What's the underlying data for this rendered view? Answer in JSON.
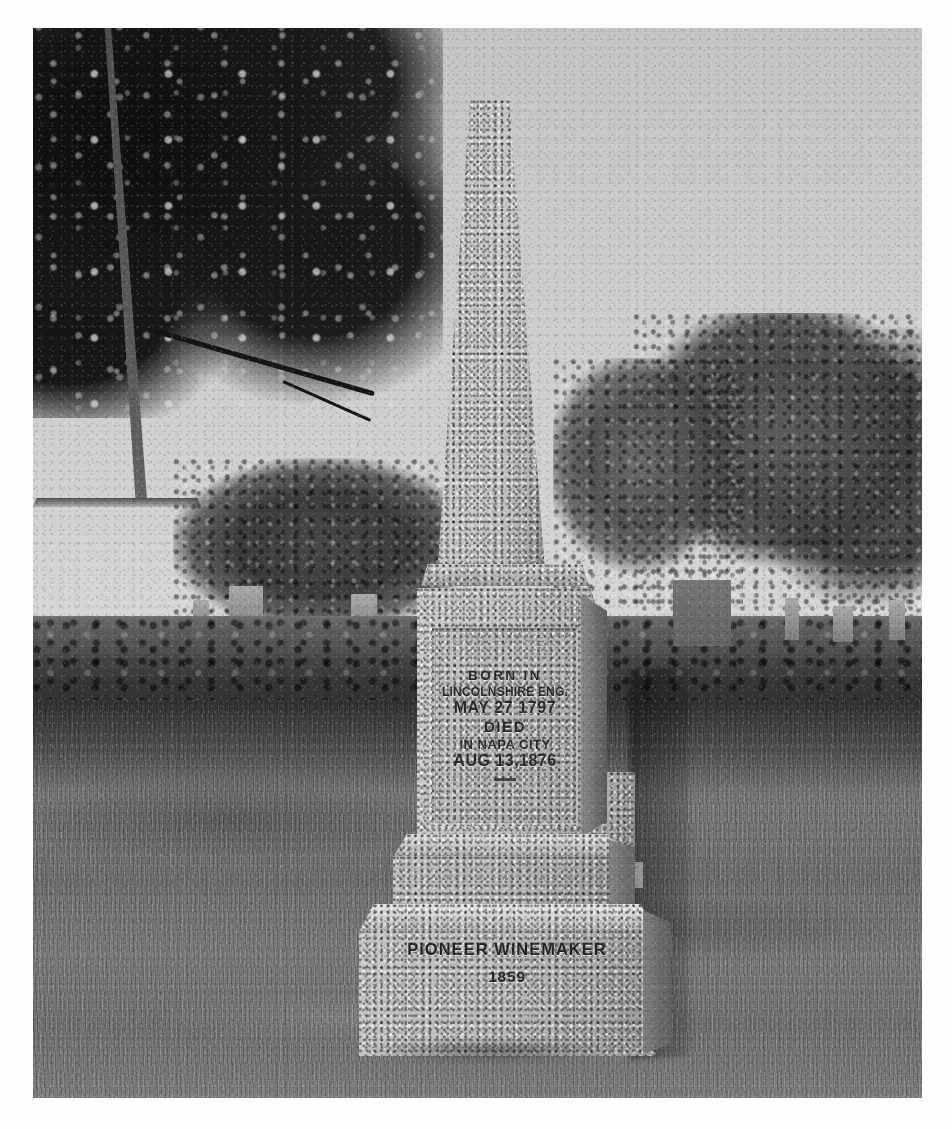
{
  "image": {
    "kind": "photograph",
    "medium": "black-and-white halftone print",
    "subject": "granite obelisk grave monument in a cemetery",
    "border": "white paper margin on all four sides"
  },
  "monument": {
    "type": "tapered granite obelisk on stepped plinth",
    "material_tone": "light speckled gray granite",
    "inscription_panel": {
      "name": "recessed front inscription panel on die block",
      "weathered_line": "OUR FATHER",
      "weathered_note": "top line heavily eroded and only partly legible",
      "lines": [
        "BORN IN",
        "LINCOLNSHIRE ENG.",
        "MAY 27 1797",
        "DIED",
        "IN NAPA CITY",
        "AUG 13,1876"
      ],
      "divider": "short horizontal rule below final line"
    },
    "base_panel": {
      "name": "lower base block inscription",
      "lines": [
        "PIONEER WINEMAKER",
        "1859"
      ]
    }
  },
  "scene": {
    "sky": "flat overcast pale gray sky",
    "left_canopy": "large dark oak tree canopy filling the upper-left corner",
    "right_trees": "cluster of mid-gray leafy trees along the right horizon",
    "mid_trees": "row of trees across the middle distance",
    "hedges": "two clipped hedge rows running left to right behind the monument",
    "background_markers": "assorted upright headstones and low monuments behind the hedges",
    "neighbor_marker": "small headstone immediately behind and right of the obelisk",
    "lawn": "mown grass foreground with mottled light and shadow",
    "foreground_shadow": "broad tree shadow crossing the upper lawn"
  },
  "colors": {
    "sky": "#c9c9c9",
    "granite_light": "#c6c6c2",
    "granite_mid": "#b2b2ae",
    "granite_shadow": "#6f6f6b",
    "canopy_dark": "#151515",
    "foliage_mid": "#545454",
    "lawn": "#77776f",
    "inscription_ink": "#2b2b28",
    "paper_margin": "#fdfdfc"
  }
}
